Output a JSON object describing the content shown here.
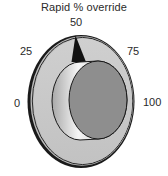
{
  "control": {
    "type": "rotary-knob",
    "title": "Rapid % override",
    "value": 50,
    "unit": "%",
    "min": 0,
    "max": 100,
    "ticks": [
      {
        "label": "0",
        "value": 0
      },
      {
        "label": "25",
        "value": 25
      },
      {
        "label": "50",
        "value": 50
      },
      {
        "label": "75",
        "value": 75
      },
      {
        "label": "100",
        "value": 100
      }
    ]
  },
  "colors": {
    "dial_face": "#c8c8c8",
    "dial_rim": "#1a1a1a",
    "knob_face": "#8e8e8e",
    "knob_side_light": "#f4f4f4",
    "knob_side_dark": "#9a9a9a",
    "pointer": "#111111",
    "text": "#2a2a2a"
  }
}
